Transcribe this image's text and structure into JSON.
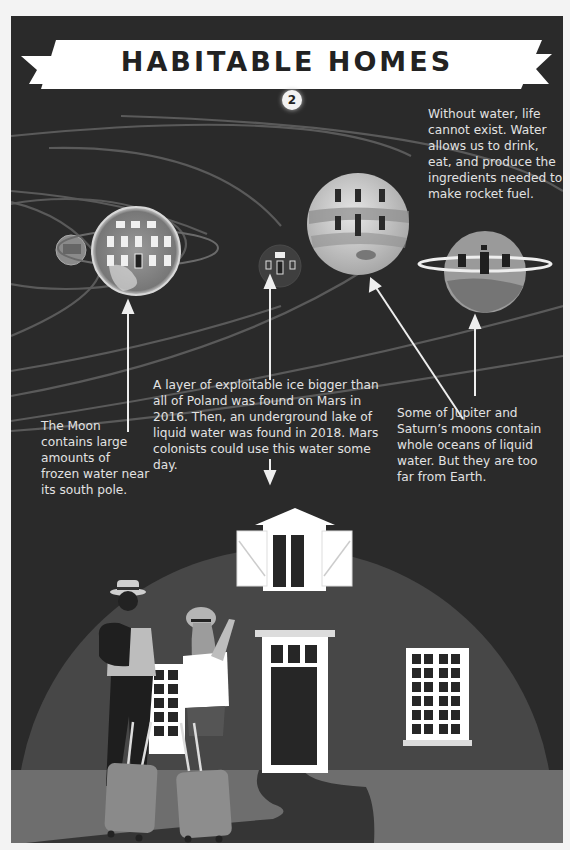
{
  "header": {
    "title": "HABITABLE HOMES",
    "step_badge": "2"
  },
  "intro_text": "Without water, life cannot exist. Water allows us to drink, eat, and produce the ingredients needed to make rocket fuel.",
  "planets": [
    {
      "name": "moon",
      "label": "Moon"
    },
    {
      "name": "earth",
      "label": "Earth"
    },
    {
      "name": "mars",
      "label": "Mars"
    },
    {
      "name": "jupiter",
      "label": "Jupiter"
    },
    {
      "name": "saturn",
      "label": "Saturn"
    }
  ],
  "callouts": {
    "moon": "The Moon contains large amounts of frozen water near its south pole.",
    "mars": "A layer of exploitable ice bigger than all of Poland was found on Mars in 2016. Then, an underground lake of liquid water was found in 2018. Mars colonists could use this water some day.",
    "giants": "Some of Jupiter and Saturn’s moons contain whole oceans of liquid water. But they are too far from Earth."
  },
  "colors": {
    "background": "#2a2a2a",
    "page": "#f3f3f3",
    "text": "#e2e2e2",
    "banner": "#ffffff",
    "dome": "#4a4a4a",
    "ground": "#6f6f6f",
    "path": "#353535"
  }
}
